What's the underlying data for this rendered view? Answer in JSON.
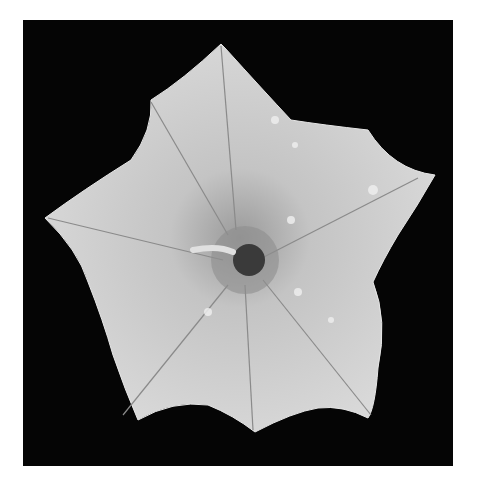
{
  "image": {
    "subject": "white five-petaled flower (morning glory) on black background",
    "style": "grayscale photograph",
    "colors": {
      "background": "#050505",
      "page": "#ffffff",
      "petal_light": "#d6d6d6",
      "petal_mid": "#b8b8b8",
      "center_dark": "#3a3a3a"
    }
  }
}
